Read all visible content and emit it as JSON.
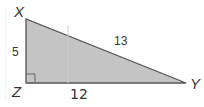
{
  "diagram": {
    "type": "right-triangle",
    "fill_color": "#c4c4c4",
    "stroke_color": "#555555",
    "vertices": {
      "X": {
        "label": "X"
      },
      "Y": {
        "label": "Y"
      },
      "Z": {
        "label": "Z"
      }
    },
    "right_angle_at": "Z",
    "sides": {
      "XZ": {
        "label": "5"
      },
      "XY": {
        "label": "13"
      },
      "ZY": {
        "label": "12"
      }
    }
  }
}
